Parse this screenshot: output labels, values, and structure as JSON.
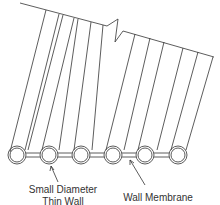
{
  "diagram": {
    "title": "",
    "stroke_color": "#333333",
    "labels": {
      "tubes_line1": "Small Diameter",
      "tubes_line2": "Thin Wall Tubes",
      "membrane": "Wall Membrane"
    },
    "tube_count": 6
  }
}
